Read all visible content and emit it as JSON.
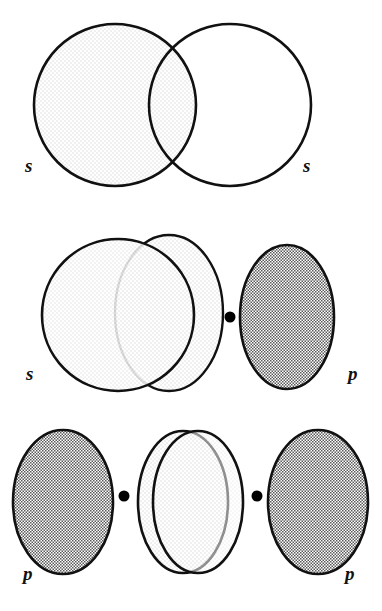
{
  "figure": {
    "background_color": "#ffffff",
    "stroke_color": "#111111",
    "width": 382,
    "height": 611
  },
  "palette": {
    "outline": "#111111",
    "s_orbital_fill": "#f7f7f7",
    "p_orbital_fill": "#b4b4b4",
    "node_dot": "#000000",
    "label_color": "#111111",
    "page_background": "#ffffff"
  },
  "panels": [
    {
      "id": "panel-s-s",
      "name": "s-s-overlap",
      "overlap_type": "s–s",
      "shapes": [
        {
          "kind": "circle",
          "role": "s-orbital",
          "fill": "s_orbital_fill",
          "cx": 115,
          "cy": 105,
          "r": 81
        },
        {
          "kind": "circle",
          "role": "s-orbital",
          "fill": "s_orbital_fill",
          "cx": 230,
          "cy": 105,
          "r": 81
        }
      ],
      "dots": [],
      "labels": [
        {
          "text": "s",
          "name": "orbital-label-s-left",
          "x": 25,
          "y": 172
        },
        {
          "text": "s",
          "name": "orbital-label-s-right",
          "x": 303,
          "y": 172
        }
      ]
    },
    {
      "id": "panel-s-p",
      "name": "s-p-overlap",
      "overlap_type": "s–p",
      "shapes": [
        {
          "kind": "circle",
          "role": "s-orbital",
          "fill": "s_orbital_fill",
          "cx": 118,
          "cy": 315,
          "r": 76
        },
        {
          "kind": "ellipse",
          "role": "p-lobe-empty",
          "fill": "s_orbital_fill",
          "cx": 169,
          "cy": 313,
          "rx": 54,
          "ry": 78
        },
        {
          "kind": "ellipse",
          "role": "p-lobe-filled",
          "fill": "p_orbital_fill",
          "cx": 287,
          "cy": 317,
          "rx": 47,
          "ry": 72
        }
      ],
      "dots": [
        {
          "name": "nucleus-dot-center",
          "cx": 230,
          "cy": 317,
          "r": 5.5
        }
      ],
      "labels": [
        {
          "text": "s",
          "name": "orbital-label-s-left",
          "x": 26,
          "y": 380
        },
        {
          "text": "p",
          "name": "orbital-label-p-right",
          "x": 348,
          "y": 380
        }
      ]
    },
    {
      "id": "panel-p-p",
      "name": "p-p-overlap",
      "overlap_type": "p–p",
      "shapes": [
        {
          "kind": "ellipse",
          "role": "p-lobe-filled",
          "fill": "p_orbital_fill",
          "cx": 63,
          "cy": 502,
          "rx": 50,
          "ry": 72
        },
        {
          "kind": "ellipse",
          "role": "p-lobe-empty",
          "fill": "s_orbital_fill",
          "cx": 183,
          "cy": 502,
          "rx": 45,
          "ry": 71
        },
        {
          "kind": "ellipse",
          "role": "p-lobe-empty",
          "fill": "s_orbital_fill",
          "cx": 198,
          "cy": 502,
          "rx": 45,
          "ry": 71
        },
        {
          "kind": "ellipse",
          "role": "p-lobe-filled",
          "fill": "p_orbital_fill",
          "cx": 318,
          "cy": 502,
          "rx": 50,
          "ry": 72
        }
      ],
      "dots": [
        {
          "name": "nucleus-dot-left",
          "cx": 124,
          "cy": 496,
          "r": 5.5
        },
        {
          "name": "nucleus-dot-right",
          "cx": 257,
          "cy": 496,
          "r": 5.5
        }
      ],
      "labels": [
        {
          "text": "p",
          "name": "orbital-label-p-left",
          "x": 23,
          "y": 580
        },
        {
          "text": "p",
          "name": "orbital-label-p-right",
          "x": 345,
          "y": 580
        }
      ]
    }
  ]
}
